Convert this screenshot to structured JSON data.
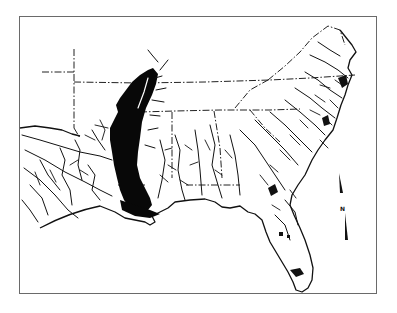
{
  "map": {
    "subject": "Southeastern United States river drainage map",
    "style": "black-and-white line drawing",
    "highlighted_region": "Lower Mississippi River alluvial valley (solid black)",
    "features": [
      "state boundaries (dash-dot)",
      "rivers and tributaries",
      "coastline",
      "Florida peninsula",
      "north arrow"
    ],
    "colors": {
      "ink": "#111111",
      "background": "#ffffff",
      "frame": "#6a6a6a"
    }
  },
  "north_arrow": {
    "label": "N"
  }
}
